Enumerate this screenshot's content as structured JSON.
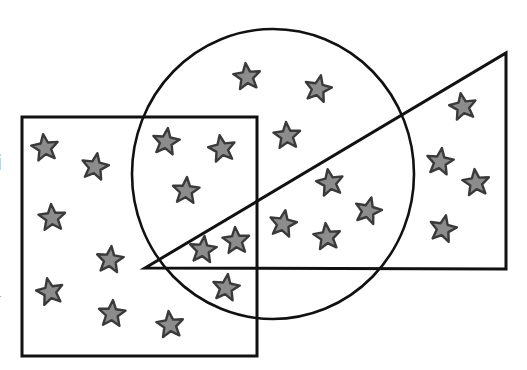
{
  "colors": {
    "background": "#ffffff",
    "outline": "#111111",
    "star_fill": "#8c8c8c",
    "star_stroke": "#3a3a3a"
  },
  "edge_glyphs": [
    "i",
    "."
  ],
  "shapes": [
    {
      "id": "square",
      "label": "square"
    },
    {
      "id": "circle",
      "label": "circle"
    },
    {
      "id": "triangle",
      "label": "triangle"
    }
  ],
  "star_counts": {
    "square_only": 7,
    "square_and_circle": 3,
    "circle_only": 3,
    "circle_and_triangle": 4,
    "square_circle_triangle": 2,
    "square_and_circle_below_triangle": 1,
    "triangle_only": 4,
    "total": 24
  }
}
